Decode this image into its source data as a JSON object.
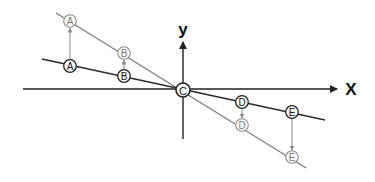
{
  "diagram": {
    "axes": {
      "x_label": "X",
      "y_label": "y",
      "color": "#222222"
    },
    "lines": {
      "shallow": {
        "color": "#2b2b2b",
        "description": "dark line through origin"
      },
      "steep": {
        "color": "#7a7a7a",
        "description": "gray line through origin"
      }
    },
    "points": [
      {
        "label": "A",
        "line": "steep",
        "style": "gray"
      },
      {
        "label": "A",
        "line": "shallow",
        "style": "dark"
      },
      {
        "label": "B",
        "line": "steep",
        "style": "gray"
      },
      {
        "label": "B",
        "line": "shallow",
        "style": "dark"
      },
      {
        "label": "C",
        "line": "origin",
        "style": "dark"
      },
      {
        "label": "D",
        "line": "shallow",
        "style": "dark"
      },
      {
        "label": "D",
        "line": "steep",
        "style": "gray"
      },
      {
        "label": "E",
        "line": "shallow",
        "style": "dark"
      },
      {
        "label": "E",
        "line": "steep",
        "style": "gray"
      }
    ]
  }
}
